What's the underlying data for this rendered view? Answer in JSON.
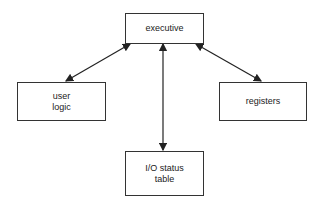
{
  "diagram": {
    "nodes": [
      {
        "id": "executive",
        "label": "executive"
      },
      {
        "id": "user-logic",
        "label": "user\nlogic"
      },
      {
        "id": "registers",
        "label": "registers"
      },
      {
        "id": "io-status-table",
        "label": "I/O status\ntable"
      }
    ],
    "edges": [
      {
        "from": "executive",
        "to": "user-logic",
        "direction": "bidirectional"
      },
      {
        "from": "executive",
        "to": "io-status-table",
        "direction": "bidirectional"
      },
      {
        "from": "executive",
        "to": "registers",
        "direction": "bidirectional"
      }
    ],
    "colors": {
      "line": "#222222",
      "box_border": "#333333",
      "background": "#ffffff"
    }
  }
}
